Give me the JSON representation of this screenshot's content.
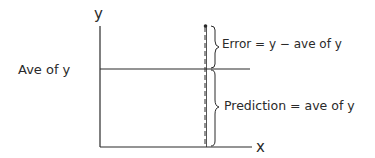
{
  "diagram": {
    "axes": {
      "y_label": "y",
      "x_label": "x"
    },
    "average_line": {
      "label": "Ave of y"
    },
    "annotations": {
      "error": "Error = y − ave of y",
      "prediction": "Prediction = ave of y"
    },
    "colors": {
      "ink": "#2a2a2a",
      "background": "#ffffff"
    }
  }
}
